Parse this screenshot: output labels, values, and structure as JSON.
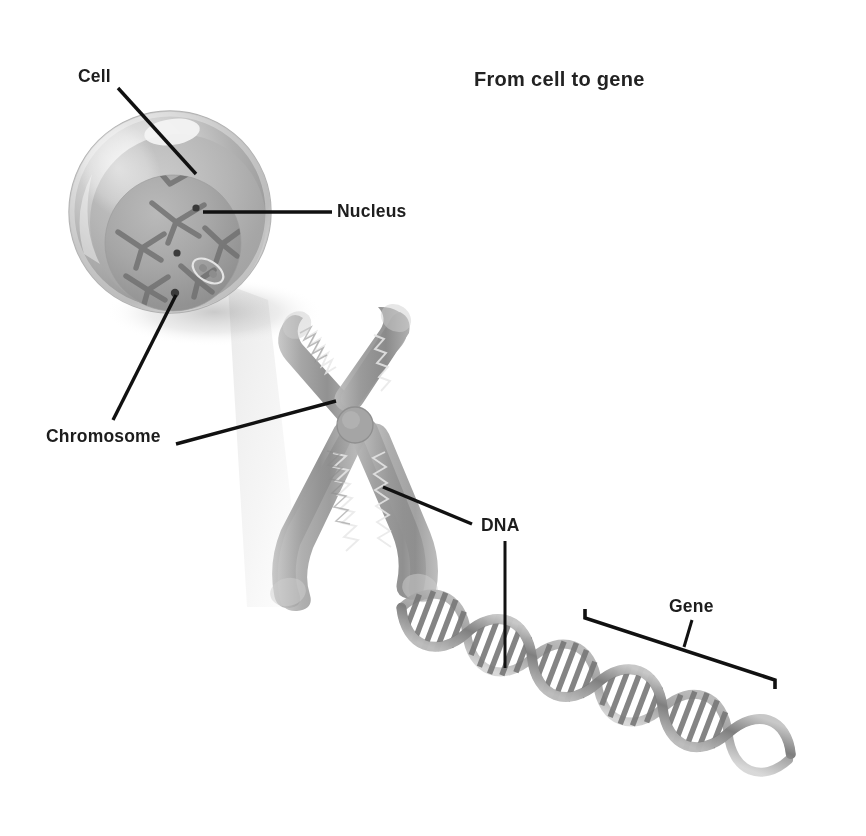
{
  "diagram": {
    "title": "From cell to gene",
    "background_color": "#ffffff",
    "text_color": "#1d1d1d",
    "labels": {
      "cell": "Cell",
      "nucleus": "Nucleus",
      "chromosome": "Chromosome",
      "dna": "DNA",
      "gene": "Gene"
    },
    "structures": [
      {
        "name": "cell",
        "description": "Shaded grey sphere with translucent membrane and highlight",
        "color": "#a8a8a8"
      },
      {
        "name": "nucleus",
        "description": "Inner darker grey sphere containing chromosomes",
        "color": "#8f8f8f"
      },
      {
        "name": "chromosome",
        "description": "Large X-shaped chromosome with centromere and coiled chromatin",
        "color": "#9a9a9a"
      },
      {
        "name": "dna",
        "description": "Double helix with base-pair rungs descending to lower right",
        "color": "#8a8a8a"
      },
      {
        "name": "gene",
        "description": "Bracket marking a segment of the DNA strand",
        "color": "#1d1d1d"
      }
    ],
    "leader_lines": [
      {
        "from": "cell-label",
        "to": "cell-membrane"
      },
      {
        "from": "nucleus-label",
        "to": "nucleus-body"
      },
      {
        "from": "chromosome-label",
        "to": "nucleus-chromosome"
      },
      {
        "from": "chromosome-label",
        "to": "large-chromosome"
      },
      {
        "from": "dna-label",
        "to": "chromosome-chromatin"
      },
      {
        "from": "dna-label",
        "to": "dna-helix"
      },
      {
        "from": "gene-label",
        "to": "gene-bracket"
      }
    ]
  }
}
